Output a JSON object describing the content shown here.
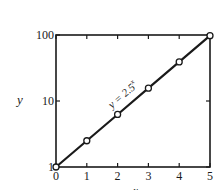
{
  "chart_data": {
    "type": "line",
    "title": "",
    "xlabel": "x",
    "ylabel": "y",
    "yscale": "log",
    "xlim": [
      0,
      5
    ],
    "ylim": [
      1,
      100
    ],
    "grid": false,
    "x_ticks": [
      "0",
      "1",
      "2",
      "3",
      "4",
      "5"
    ],
    "y_ticks": [
      "1",
      "10",
      "100"
    ],
    "annotation": "y = 2.5^x",
    "annotation_display": {
      "base": "y = 2.5",
      "exp": "x"
    },
    "series": [
      {
        "name": "y = 2.5^x",
        "x": [
          0,
          1,
          2,
          3,
          4,
          5
        ],
        "values": [
          1,
          2.5,
          6.25,
          15.625,
          39.0625,
          97.65625
        ],
        "marker": "open-circle",
        "line_color": "#1a1a1a"
      }
    ]
  },
  "colors": {
    "ink": "#1a1a1a",
    "background": "#ffffff"
  }
}
